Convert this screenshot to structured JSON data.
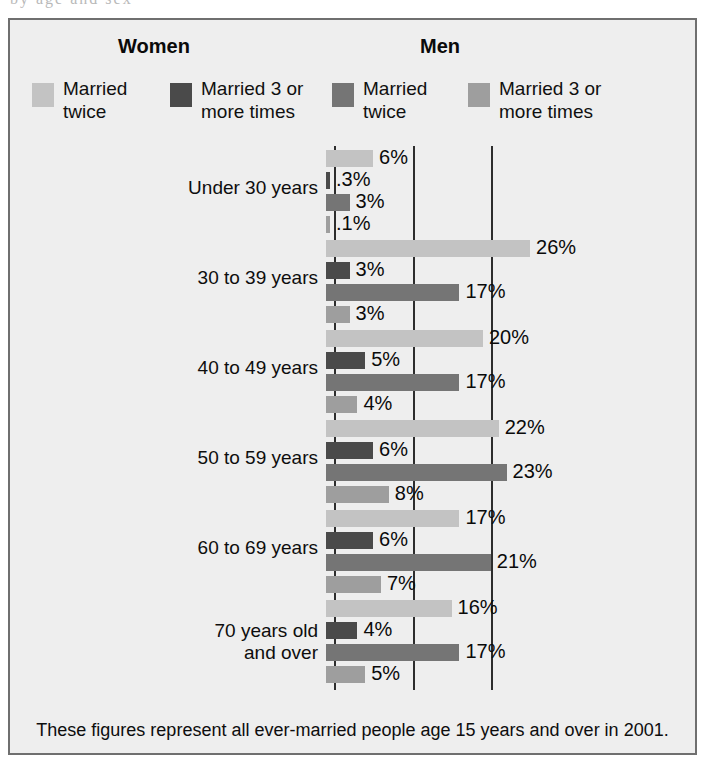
{
  "artifact": {
    "text": "by age and sex"
  },
  "header": {
    "women_label": "Women",
    "men_label": "Men"
  },
  "legend": [
    {
      "label": "Married\ntwice",
      "color": "#c3c3c3",
      "series": "women-married-twice"
    },
    {
      "label": "Married 3 or\nmore times",
      "color": "#4a4a4a",
      "series": "women-married-3-or-more"
    },
    {
      "label": "Married\ntwice",
      "color": "#757575",
      "series": "men-married-twice"
    },
    {
      "label": "Married 3 or\nmore times",
      "color": "#9e9e9e",
      "series": "men-married-3-or-more"
    }
  ],
  "footnote": "These figures represent all ever-married people age 15 years and over in 2001.",
  "chart_data": {
    "type": "bar",
    "orientation": "horizontal",
    "title": "",
    "xlabel": "",
    "ylabel": "",
    "xlim": [
      0,
      30
    ],
    "gridlines": [
      0,
      10,
      20
    ],
    "grid": true,
    "legend_position": "top",
    "categories": [
      "Under 30 years",
      "30 to 39 years",
      "40 to 49 years",
      "50 to 59 years",
      "60 to 69 years",
      "70 years old\nand over"
    ],
    "series": [
      {
        "name": "Women — Married twice",
        "color": "#c3c3c3",
        "values": [
          6,
          26,
          20,
          22,
          17,
          16
        ],
        "labels": [
          "6%",
          "26%",
          "20%",
          "22%",
          "17%",
          "16%"
        ]
      },
      {
        "name": "Women — Married 3 or more times",
        "color": "#4a4a4a",
        "values": [
          0.3,
          3,
          5,
          6,
          6,
          4
        ],
        "labels": [
          ".3%",
          "3%",
          "5%",
          "6%",
          "6%",
          "4%"
        ]
      },
      {
        "name": "Men — Married twice",
        "color": "#757575",
        "values": [
          3,
          17,
          17,
          23,
          21,
          17
        ],
        "labels": [
          "3%",
          "17%",
          "17%",
          "23%",
          "21%",
          "17%"
        ]
      },
      {
        "name": "Men — Married 3 or more times",
        "color": "#9e9e9e",
        "values": [
          0.1,
          3,
          4,
          8,
          7,
          5
        ],
        "labels": [
          ".1%",
          "3%",
          "4%",
          "8%",
          "7%",
          "5%"
        ]
      }
    ]
  }
}
